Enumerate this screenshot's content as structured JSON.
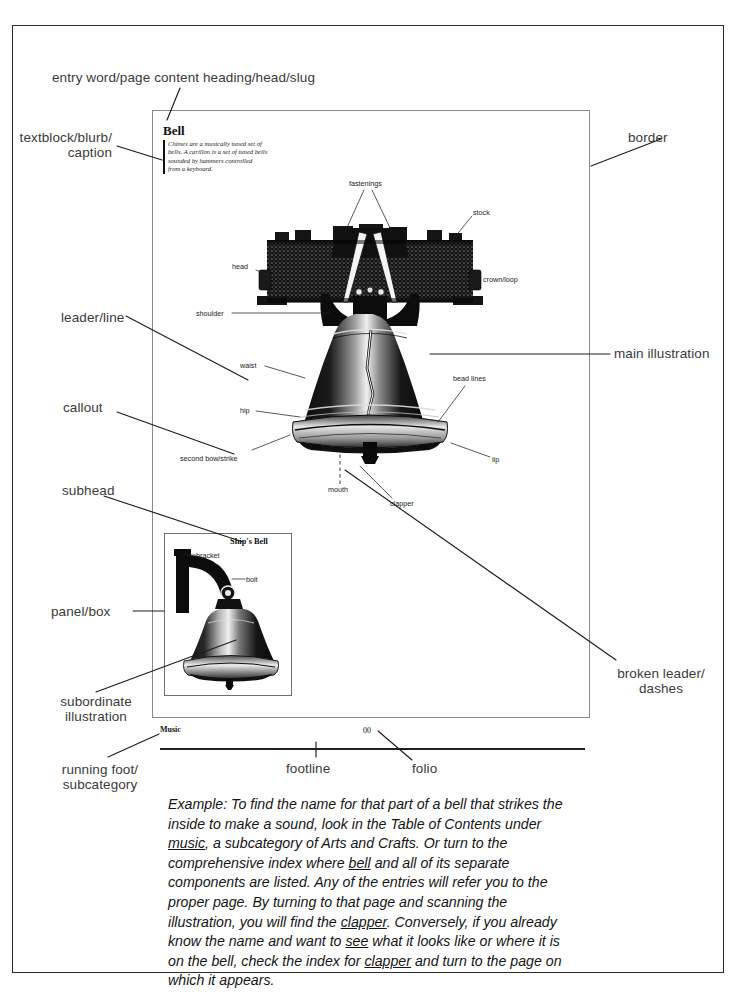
{
  "figure": {
    "page": {
      "entry_word": "Bell",
      "blurb_lines": [
        "Chimes are a musically tuned set of",
        "bells. A carillon is a set of tuned bells",
        "sounded by  hammers  controlled",
        "from a keyboard."
      ],
      "blurb_text": "Chimes are a musically tuned set of bells. A carillon is a set of tuned bells sounded by hammers controlled from a keyboard.",
      "running_foot": "Music",
      "folio": "00",
      "panel": {
        "heading": "Ship's Bell",
        "labels": [
          "bracket",
          "bolt"
        ]
      },
      "illustration_labels": [
        "fastenings",
        "stock",
        "head",
        "crown/loop",
        "shoulder",
        "waist",
        "bead lines",
        "hip",
        "lip",
        "second bow/strike",
        "mouth",
        "clapper"
      ]
    },
    "annotations": {
      "entry_word": "entry word/page content heading/head/slug",
      "textblock": "textblock/blurb/\ncaption",
      "leader": "leader/line",
      "callout": "callout",
      "subhead": "subhead",
      "panel_box": "panel/box",
      "subordinate": "subordinate\nillustration",
      "running_foot": "running foot/\nsubcategory",
      "border": "border",
      "main_illustration": "main illustration",
      "broken_leader": "broken leader/\ndashes",
      "footline": "footline",
      "folio": "folio"
    },
    "example": {
      "lead": "Example:",
      "paragraph": "Example: To find the name for that part of a bell that strikes the inside to make a sound, look in the Table of Contents under music, a subcategory of Arts and Crafts. Or turn to the comprehensive index where bell and all of its separate components are listed. Any of the entries will refer you to the proper page. By turning to that page and scanning the illustration, you will find the clapper. Conversely, if you already know the name and want to see what it looks like or where it is on the bell, check the index for clapper and turn to the page on which it appears.",
      "underlined_terms": [
        "music",
        "bell",
        "clapper",
        "see",
        "clapper"
      ]
    },
    "colors": {
      "ink": "#1a1a1a",
      "annotation": "#3a3a3a",
      "page_border": "#8a8a8a",
      "frame": "#2b2b2b",
      "paper": "#ffffff"
    }
  }
}
